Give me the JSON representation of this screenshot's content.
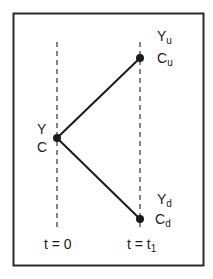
{
  "diagram": {
    "type": "binomial-tree",
    "colors": {
      "line": "#1a1a1a",
      "frame": "#2a2a2a",
      "background": "#ffffff"
    },
    "nodes": [
      {
        "id": "root",
        "label_top": "Y",
        "label_bottom": "C",
        "time": "t = 0"
      },
      {
        "id": "up",
        "label_top_base": "Y",
        "label_top_sub": "u",
        "label_bottom_base": "C",
        "label_bottom_sub": "u",
        "time": "t = t1"
      },
      {
        "id": "down",
        "label_top_base": "Y",
        "label_top_sub": "d",
        "label_bottom_base": "C",
        "label_bottom_sub": "d",
        "time": "t = t1"
      }
    ],
    "edges": [
      {
        "from": "root",
        "to": "up"
      },
      {
        "from": "root",
        "to": "down"
      }
    ],
    "axis": {
      "t0_label": "t = 0",
      "t1_label_base": "t = t",
      "t1_label_sub": "1"
    }
  }
}
